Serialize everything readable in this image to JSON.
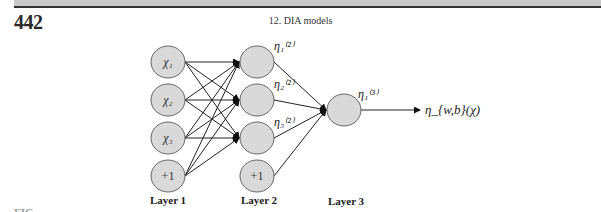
{
  "header": {
    "page_number": "442",
    "running_head": "12. DIA models"
  },
  "figure": {
    "layers": [
      {
        "label": "Layer 1",
        "nodes": [
          "χ₁",
          "χ₂",
          "χ₃",
          "+1"
        ]
      },
      {
        "label": "Layer 2",
        "nodes": [
          "",
          "",
          "",
          "+1"
        ],
        "annotations": [
          "η₁⁽²⁾",
          "η₂⁽²⁾",
          "η₃⁽²⁾"
        ]
      },
      {
        "label": "Layer 3",
        "nodes": [
          ""
        ],
        "annotations": [
          "η₁⁽³⁾"
        ]
      }
    ],
    "output_label": "η_{w,b}(χ)",
    "node_fill": "#d9d9d9",
    "edge_color": "#222222"
  },
  "caption_cut": "FIG"
}
